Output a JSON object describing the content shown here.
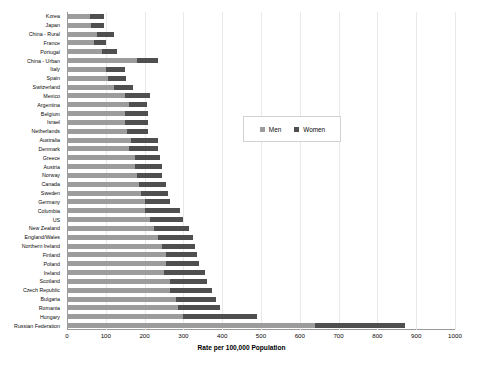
{
  "chart_data": {
    "type": "bar",
    "subtype": "stacked-horizontal",
    "title": "",
    "xlabel": "Rate per 100,000 Population",
    "ylabel": "",
    "xlim": [
      0,
      1000
    ],
    "xticks": [
      0,
      100,
      200,
      300,
      400,
      500,
      600,
      700,
      800,
      900,
      1000
    ],
    "grid": true,
    "grid_axis": "x",
    "legend": [
      "Men",
      "Women"
    ],
    "legend_position": "center",
    "colors": {
      "Men": "#9c9c9c",
      "Women": "#4f4f4f",
      "gridline": "#e9e9e9",
      "axis": "#9a9a9a",
      "background": "#ffffff"
    },
    "categories": [
      "Korea",
      "Japan",
      "China - Rural",
      "France",
      "Portugal",
      "China - Urban",
      "Italy",
      "Spain",
      "Switzerland",
      "Mexico",
      "Argentina",
      "Belgium",
      "Israel",
      "Netherlands",
      "Australia",
      "Denmark",
      "Greece",
      "Austria",
      "Norway",
      "Canada",
      "Sweden",
      "Germany",
      "Columbia",
      "US",
      "New Zealand",
      "England/Wales",
      "Northern Ireland",
      "Finland",
      "Poland",
      "Ireland",
      "Scotland",
      "Czech Republic",
      "Bulgaria",
      "Romania",
      "Hungary",
      "Russian Federation"
    ],
    "series": [
      {
        "name": "Men",
        "values": [
          58,
          62,
          78,
          70,
          90,
          180,
          100,
          105,
          120,
          150,
          160,
          150,
          150,
          155,
          165,
          160,
          175,
          175,
          180,
          185,
          190,
          200,
          200,
          215,
          225,
          235,
          245,
          255,
          255,
          250,
          265,
          265,
          280,
          285,
          300,
          640
        ]
      },
      {
        "name": "Women",
        "values": [
          37,
          33,
          43,
          30,
          40,
          55,
          50,
          48,
          50,
          65,
          45,
          60,
          60,
          55,
          70,
          75,
          65,
          70,
          65,
          70,
          70,
          65,
          90,
          85,
          90,
          90,
          85,
          80,
          85,
          105,
          95,
          110,
          105,
          110,
          190,
          230
        ]
      }
    ],
    "totals": [
      95,
      95,
      121,
      100,
      130,
      235,
      150,
      153,
      170,
      215,
      205,
      210,
      210,
      210,
      235,
      235,
      240,
      245,
      245,
      255,
      260,
      265,
      290,
      300,
      315,
      325,
      330,
      335,
      340,
      355,
      360,
      375,
      385,
      395,
      490,
      870
    ]
  },
  "legend": {
    "men_label": "Men",
    "women_label": "Women"
  },
  "axis": {
    "title": "Rate per 100,000 Population"
  }
}
